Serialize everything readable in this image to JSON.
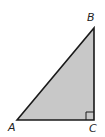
{
  "diagram": {
    "type": "right-triangle",
    "fill_color": "#c8c8c8",
    "stroke_color": "#1a1a1a",
    "vertices": [
      {
        "label": "A",
        "x": 17,
        "y": 120
      },
      {
        "label": "B",
        "x": 94,
        "y": 28
      },
      {
        "label": "C",
        "x": 94,
        "y": 120
      }
    ],
    "right_angle_at": "C",
    "labels": {
      "a": "A",
      "b": "B",
      "c": "C"
    }
  }
}
